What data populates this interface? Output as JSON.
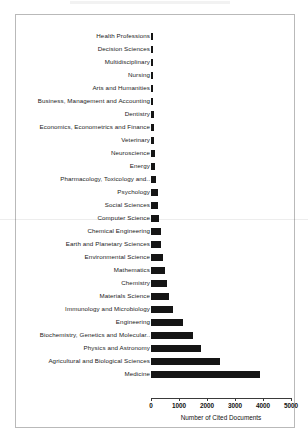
{
  "chart_data": {
    "type": "bar",
    "orientation": "horizontal",
    "title": "",
    "xlabel": "Number of Cited Documents",
    "ylabel": "",
    "xlim": [
      0,
      5000
    ],
    "xticks": [
      0,
      1000,
      2000,
      3000,
      4000,
      5000
    ],
    "xtick_labels": [
      "0",
      "1000",
      "2000",
      "3000",
      "4000",
      "5000"
    ],
    "grid": false,
    "legend": false,
    "bar_color": "#151515",
    "categories": [
      "Health Professions",
      "Decision Sciences",
      "Multidisciplinary",
      "Nursing",
      "Arts and Humanities",
      "Business, Management and Accounting",
      "Dentistry",
      "Economics, Econometrics and Finance",
      "Veterinary",
      "Neuroscience",
      "Energy",
      "Pharmacology, Toxicology and..",
      "Psychology",
      "Social Sciences",
      "Computer Science",
      "Chemical Engineering",
      "Earth and Planetary Sciences",
      "Environmental Science",
      "Mathematics",
      "Chemistry",
      "Materials Science",
      "Immunology and Microbiology",
      "Engineering",
      "Biochemistry, Genetics and Molecular..",
      "Physics and Astronomy",
      "Agricultural and Biological Sciences",
      "Medicine"
    ],
    "values": [
      40,
      45,
      55,
      60,
      80,
      85,
      90,
      110,
      115,
      125,
      150,
      175,
      235,
      260,
      290,
      350,
      365,
      430,
      490,
      560,
      640,
      790,
      1150,
      1500,
      1770,
      2450,
      3900
    ]
  }
}
